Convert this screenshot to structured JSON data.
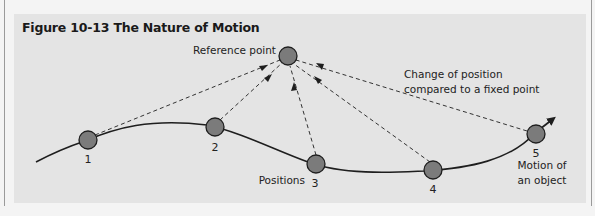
{
  "figure": {
    "title": "Figure 10-13  The Nature of Motion",
    "reference_point_label": "Reference point",
    "change_label_line1": "Change of position",
    "change_label_line2": "compared to a fixed point",
    "positions_label": "Positions",
    "motion_label_line1": "Motion of",
    "motion_label_line2": "an object",
    "positions": [
      {
        "label": "1"
      },
      {
        "label": "2"
      },
      {
        "label": "3"
      },
      {
        "label": "4"
      },
      {
        "label": "5"
      }
    ]
  },
  "colors": {
    "panel_background": "#e4e4e4",
    "page_background": "#f4f4f4",
    "circle_fill": "#7b7b7b",
    "stroke": "#1e1e1e"
  }
}
